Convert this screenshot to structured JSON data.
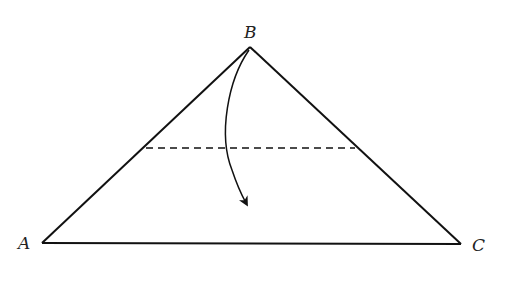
{
  "diagram": {
    "type": "triangle-fold",
    "colors": {
      "stroke": "#111111",
      "background": "#ffffff"
    },
    "vertices": [
      {
        "label": "A",
        "x": 42,
        "y": 243
      },
      {
        "label": "B",
        "x": 250,
        "y": 47
      },
      {
        "label": "C",
        "x": 461,
        "y": 244
      }
    ],
    "fold_line": {
      "style": "dashed",
      "x1": 146,
      "y1": 148,
      "x2": 355,
      "y2": 148
    },
    "arrow": {
      "from": "B",
      "direction": "down",
      "description": "fold apex B down across dashed line"
    }
  },
  "labels": {
    "a": "A",
    "b": "B",
    "c": "C"
  }
}
